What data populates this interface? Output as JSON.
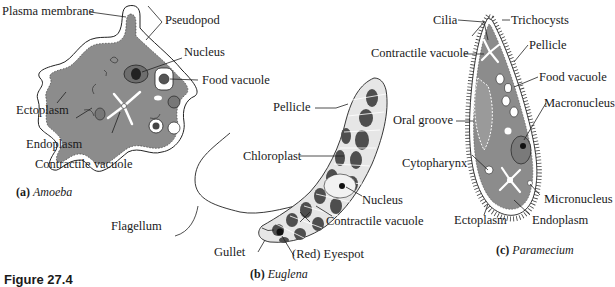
{
  "figure": {
    "number_label": "Figure 27.4",
    "colors": {
      "cytoplasm": "#8c8c8c",
      "chloroplast": "#4e4e4e",
      "outline": "#222222",
      "background": "#ffffff"
    }
  },
  "panels": [
    {
      "id": "a",
      "caption_letter": "(a)",
      "caption_name": "Amoeba",
      "labels": [
        "Plasma membrane",
        "Pseudopod",
        "Nucleus",
        "Food vacuole",
        "Ectoplasm",
        "Endoplasm",
        "Contractile vacuole"
      ]
    },
    {
      "id": "b",
      "caption_letter": "(b)",
      "caption_name": "Euglena",
      "labels": [
        "Pellicle",
        "Chloroplast",
        "Nucleus",
        "Contractile vacuole",
        "Flagellum",
        "Gullet",
        "(Red) Eyespot"
      ]
    },
    {
      "id": "c",
      "caption_letter": "(c)",
      "caption_name": "Paramecium",
      "labels": [
        "Cilia",
        "Trichocysts",
        "Contractile vacuole",
        "Pellicle",
        "Food vacuole",
        "Macronucleus",
        "Oral groove",
        "Cytopharynx",
        "Micronucleus",
        "Ectoplasm",
        "Endoplasm"
      ]
    }
  ]
}
